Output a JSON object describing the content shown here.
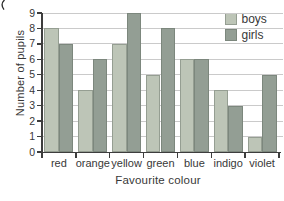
{
  "chart_data": {
    "type": "bar",
    "title": "",
    "xlabel": "Favourite colour",
    "ylabel": "Number of pupils",
    "categories": [
      "red",
      "orange",
      "yellow",
      "green",
      "blue",
      "indigo",
      "violet"
    ],
    "series": [
      {
        "name": "boys",
        "color": "#bdc5b7",
        "values": [
          8,
          4,
          7,
          5,
          6,
          4,
          1
        ]
      },
      {
        "name": "girls",
        "color": "#939e94",
        "values": [
          7,
          6,
          9,
          8,
          6,
          3,
          5
        ]
      }
    ],
    "ylim": [
      0,
      9
    ],
    "yticks": [
      0,
      1,
      2,
      3,
      4,
      5,
      6,
      7,
      8,
      9
    ],
    "grid": "horizontal",
    "legend_position": "top-right",
    "colors": {
      "background": "#ffffff",
      "gridline": "#cacaca",
      "axis": "#3d3d3d",
      "text": "#383838",
      "bar_outline": "rgba(90,100,90,0.4)"
    }
  }
}
